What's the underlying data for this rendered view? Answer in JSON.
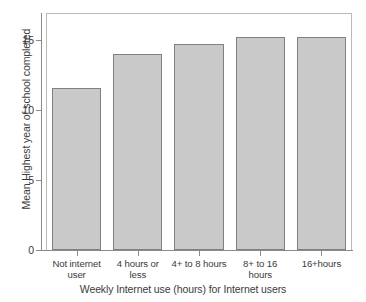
{
  "chart_data": {
    "type": "bar",
    "title": "",
    "subtitle": "",
    "xlabel": "Weekly Internet use (hours) for Internet users",
    "ylabel": "Mean Highest year of school completed",
    "categories": [
      "Not internet user",
      "4 hours or less",
      "4+ to 8 hours",
      "8+ to 16 hours",
      "16+hours"
    ],
    "category_lines": [
      [
        "Not internet",
        "user"
      ],
      [
        "4 hours or",
        "less"
      ],
      [
        "4+ to 8 hours"
      ],
      [
        "8+ to 16",
        "hours"
      ],
      [
        "16+hours"
      ]
    ],
    "values": [
      11.55,
      14.0,
      14.7,
      15.2,
      15.2
    ],
    "ylim": [
      0,
      16.9
    ],
    "yticks": [
      0,
      5,
      10,
      15
    ],
    "ytick_labels": [
      "0",
      "5",
      "10",
      "15"
    ],
    "grid": false,
    "legend": false,
    "bar_fill_color": "#c9c9c9",
    "bar_edge_color": "#808080",
    "axis_color": "#8a8a8a",
    "frame_color": "#b9b9b9",
    "text_color": "#3c3c3c",
    "background_color": "#ffffff"
  }
}
